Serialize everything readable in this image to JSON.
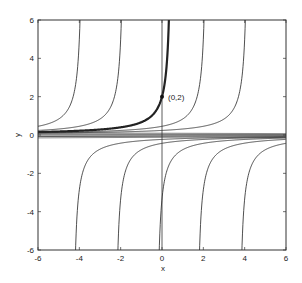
{
  "chart_data": {
    "type": "line",
    "title": "",
    "xlabel": "x",
    "ylabel": "y",
    "xlim": [
      -6,
      6
    ],
    "ylim": [
      -6,
      6
    ],
    "grid": false,
    "legend": null,
    "xticks": [
      -6,
      -4,
      -2,
      0,
      2,
      4,
      6
    ],
    "yticks": [
      -6,
      -4,
      -2,
      0,
      2,
      4,
      6
    ],
    "xtick_labels": [
      "-6",
      "-4",
      "-2",
      "0",
      "2",
      "4",
      "6"
    ],
    "ytick_labels": [
      "-6",
      "-4",
      "-2",
      "0",
      "2",
      "4",
      "6"
    ],
    "curve_family": "y = 1/(C - x)",
    "series": [
      {
        "name": "solution C=-3.8",
        "C": -3.8,
        "branch": "left",
        "bold": false
      },
      {
        "name": "solution C=-1.8",
        "C": -1.8,
        "branch": "left",
        "bold": false
      },
      {
        "name": "solution through (0,2)",
        "C": 0.5,
        "branch": "left",
        "bold": true
      },
      {
        "name": "solution C=2.2",
        "C": 2.2,
        "branch": "left",
        "bold": false
      },
      {
        "name": "solution C=4.2",
        "C": 4.2,
        "branch": "left",
        "bold": false
      },
      {
        "name": "solution C=-4.35",
        "C": -4.35,
        "branch": "right",
        "bold": false
      },
      {
        "name": "solution C=-2.3",
        "C": -2.3,
        "branch": "right",
        "bold": false
      },
      {
        "name": "solution C=-0.3",
        "C": -0.3,
        "branch": "right",
        "bold": false
      },
      {
        "name": "solution C=1.65",
        "C": 1.65,
        "branch": "right",
        "bold": false
      },
      {
        "name": "solution C=3.7",
        "C": 3.7,
        "branch": "right",
        "bold": false
      },
      {
        "name": "equilibrium y=0",
        "C": null,
        "branch": "zero",
        "bold": false
      }
    ],
    "vertical_lines": [
      {
        "x": 0
      }
    ],
    "annotations": [
      {
        "text": "(0,2)",
        "x": 0,
        "y": 2,
        "marker": "dot"
      }
    ]
  },
  "labels": {
    "xlabel": "x",
    "ylabel": "y",
    "point": "(0,2)"
  }
}
